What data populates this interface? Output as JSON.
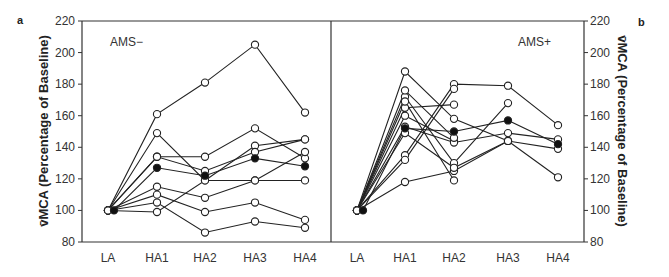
{
  "figure": {
    "panel_a_tag": "a",
    "panel_b_tag": "b",
    "ylabel_left": "v̄MCA (Percentage of Baseline)",
    "ylabel_right": "v̄MCA (Percentage of Baseline)"
  },
  "chart_data": [
    {
      "type": "line",
      "panel": "a",
      "title": "AMS−",
      "xlabel": "",
      "ylabel": "v̄MCA (Percentage of Baseline)",
      "categories": [
        "LA",
        "HA1",
        "HA2",
        "HA3",
        "HA4"
      ],
      "ylim": [
        80,
        220
      ],
      "yticks": [
        80,
        100,
        120,
        140,
        160,
        180,
        200,
        220
      ],
      "grid": false,
      "markers": "open circles (individuals), filled circles (mean)",
      "series": [
        {
          "name": "subject-1",
          "values": [
            100,
            161,
            181,
            205,
            162
          ],
          "filled": false
        },
        {
          "name": "subject-2",
          "values": [
            100,
            149,
            119,
            141,
            145
          ],
          "filled": false
        },
        {
          "name": "subject-3",
          "values": [
            100,
            134,
            134,
            152,
            133
          ],
          "filled": false
        },
        {
          "name": "subject-4",
          "values": [
            100,
            134,
            125,
            137,
            145
          ],
          "filled": false
        },
        {
          "name": "subject-5",
          "values": [
            100,
            115,
            108,
            119,
            137
          ],
          "filled": false
        },
        {
          "name": "subject-6",
          "values": [
            100,
            99,
            119,
            119,
            119
          ],
          "filled": false
        },
        {
          "name": "subject-7",
          "values": [
            100,
            110,
            99,
            105,
            94
          ],
          "filled": false
        },
        {
          "name": "subject-8",
          "values": [
            100,
            105,
            86,
            93,
            89
          ],
          "filled": false
        },
        {
          "name": "mean",
          "values": [
            100,
            127,
            122,
            133,
            128
          ],
          "filled": true
        }
      ]
    },
    {
      "type": "line",
      "panel": "b",
      "title": "AMS+",
      "xlabel": "",
      "ylabel": "v̄MCA (Percentage of Baseline)",
      "categories": [
        "LA",
        "HA1",
        "HA2",
        "HA3",
        "HA4"
      ],
      "ylim": [
        80,
        220
      ],
      "yticks": [
        80,
        100,
        120,
        140,
        160,
        180,
        200,
        220
      ],
      "grid": false,
      "markers": "open circles (individuals), filled circles (mean)",
      "series": [
        {
          "name": "subject-1",
          "values": [
            100,
            188,
            158,
            144,
            121
          ],
          "filled": false
        },
        {
          "name": "subject-2",
          "values": [
            100,
            135,
            180,
            179,
            154
          ],
          "filled": false
        },
        {
          "name": "subject-3",
          "values": [
            100,
            132,
            177,
            null,
            null
          ],
          "filled": false
        },
        {
          "name": "subject-4",
          "values": [
            100,
            165,
            167,
            null,
            null
          ],
          "filled": false
        },
        {
          "name": "subject-5",
          "values": [
            100,
            118,
            125,
            144,
            139
          ],
          "filled": false
        },
        {
          "name": "subject-6",
          "values": [
            100,
            172,
            130,
            168,
            null
          ],
          "filled": false
        },
        {
          "name": "subject-7",
          "values": [
            100,
            169,
            119,
            null,
            null
          ],
          "filled": false
        },
        {
          "name": "subject-8",
          "values": [
            100,
            160,
            144,
            null,
            null
          ],
          "filled": false
        },
        {
          "name": "subject-9",
          "values": [
            100,
            149,
            127,
            144,
            null
          ],
          "filled": false
        },
        {
          "name": "subject-10",
          "values": [
            100,
            153,
            143,
            149,
            145
          ],
          "filled": false
        },
        {
          "name": "subject-11",
          "values": [
            100,
            176,
            146,
            null,
            null
          ],
          "filled": false
        },
        {
          "name": "mean",
          "values": [
            100,
            152,
            150,
            157,
            142
          ],
          "filled": true
        }
      ]
    }
  ]
}
